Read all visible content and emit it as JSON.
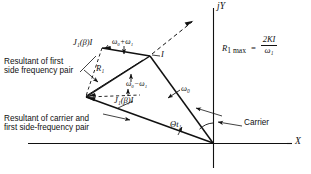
{
  "figure": {
    "name": "phasor-vector-diagram",
    "background_color": "#ffffff",
    "line_color": "#111111"
  },
  "axes": {
    "vertical_label": "jY",
    "horizontal_label": "X",
    "origin_label": ""
  },
  "annotations": {
    "resultant_first_side_pair_line1": "Resultant of first",
    "resultant_first_side_pair_line2": "side frequency pair",
    "resultant_carrier_line1": "Resultant of carrier and",
    "resultant_carrier_line2": "first side-frequency pair",
    "carrier_label": "Carrier"
  },
  "vectors": {
    "upper_sideband_amplitude": "J₁(β)I",
    "upper_sideband_frequency": "ω₀+ω₁",
    "lower_sideband_amplitude": "J₁(β)I",
    "lower_sideband_frequency": "ω₀−ω₁",
    "carrier_frequency": "ω₀",
    "resultant_r1": "R₁",
    "total_current": "I",
    "angle_theta": "Θt₁"
  },
  "formula": {
    "lhs": "R",
    "lhs_sub": "1 max",
    "equals": "=",
    "numerator": "2KI",
    "denominator": "ω₁",
    "full_text": "R1 max = 2KI / ω1"
  }
}
